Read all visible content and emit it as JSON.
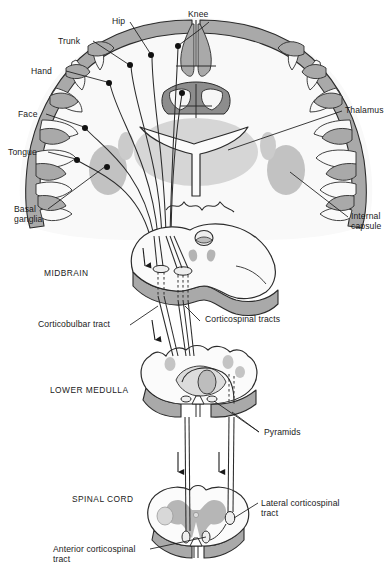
{
  "figure": {
    "background_color": "#ffffff",
    "ink_color": "#1a1a1a",
    "palette": {
      "cortex_gray": "#a9a9a9",
      "deep_gray": "#c9c9c9",
      "pale_gray": "#dedede",
      "white_matter": "#f7f7f7",
      "outline": "#2b2b2b"
    }
  },
  "labels": {
    "knee": "Knee",
    "hip": "Hip",
    "trunk": "Trunk",
    "hand": "Hand",
    "face": "Face",
    "tongue": "Tongue",
    "basal_ganglia": "Basal\nganglia",
    "thalamus": "Thalamus",
    "internal_capsule": "Internal\ncapsule",
    "midbrain": "MIDBRAIN",
    "corticobulbar_tract": "Corticobulbar tract",
    "corticospinal_tracts": "Corticospinal tracts",
    "lower_medulla": "LOWER MEDULLA",
    "pyramids": "Pyramids",
    "spinal_cord": "SPINAL CORD",
    "lateral_corticospinal_tract": "Lateral corticospinal\ntract",
    "anterior_corticospinal_tract": "Anterior corticospinal\ntract"
  },
  "sections": [
    {
      "name": "cerebral-hemispheres",
      "label": "",
      "level": "Coronal section through cerebrum"
    },
    {
      "name": "midbrain",
      "label": "MIDBRAIN",
      "level": "Midbrain cross-section"
    },
    {
      "name": "lower-medulla",
      "label": "LOWER MEDULLA",
      "level": "Lower medulla cross-section"
    },
    {
      "name": "spinal-cord",
      "label": "SPINAL CORD",
      "level": "Spinal cord cross-section"
    }
  ],
  "homunculus_points": [
    {
      "name": "knee",
      "label": "Knee"
    },
    {
      "name": "hip",
      "label": "Hip"
    },
    {
      "name": "trunk",
      "label": "Trunk"
    },
    {
      "name": "hand",
      "label": "Hand"
    },
    {
      "name": "face",
      "label": "Face"
    },
    {
      "name": "tongue",
      "label": "Tongue"
    }
  ]
}
